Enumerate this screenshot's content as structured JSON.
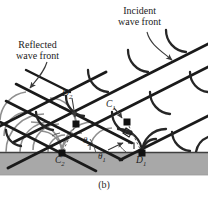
{
  "figure": {
    "caption": "(b)",
    "title_annotations": {
      "incident_line1": "Incident",
      "incident_line2": "wave front",
      "reflected_line1": "Reflected",
      "reflected_line2": "wave front"
    },
    "point_labels": {
      "D2": "D",
      "D2_sub": "2",
      "C1": "C",
      "C1_sub": "1",
      "C2": "C",
      "C2_sub": "2",
      "D1": "D",
      "D1_sub": "1"
    },
    "angle_labels": {
      "theta1": "θ",
      "theta1_sub": "1",
      "theta2": "θ",
      "theta2_sub": "2"
    },
    "colors": {
      "background": "#ffffff",
      "surface_fill": "#a8a8a8",
      "surface_edge": "#4a4a4a",
      "wavefront_line": "#1a1a1a",
      "wavelet_dark": "#2b2b2b",
      "wavelet_gray": "#8c8c8c",
      "node_fill": "#111111",
      "leader_line": "#3a3a3a",
      "text": "#1c1c1c"
    },
    "geometry": {
      "surface_top_y": 152,
      "surface_bottom_y": 175,
      "nodes": [
        {
          "name": "C2",
          "x": 62,
          "y": 153
        },
        {
          "name": "D1",
          "x": 142,
          "y": 153
        },
        {
          "name": "D2",
          "x": 76,
          "y": 124
        },
        {
          "name": "C1",
          "x": 127,
          "y": 122
        }
      ],
      "incident_front_slope_deg": 27,
      "reflected_front_slope_deg": -27
    }
  }
}
